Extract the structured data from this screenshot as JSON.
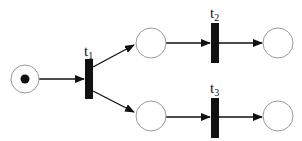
{
  "diagram": {
    "type": "petri-net",
    "colors": {
      "stroke": "#9a9a9a",
      "arc": "#111111",
      "transition": "#111111",
      "token": "#111111"
    },
    "places": [
      {
        "id": "p1",
        "tokens": 1
      },
      {
        "id": "p2",
        "tokens": 0
      },
      {
        "id": "p3",
        "tokens": 0
      },
      {
        "id": "p4",
        "tokens": 0
      },
      {
        "id": "p5",
        "tokens": 0
      }
    ],
    "transitions": [
      {
        "id": "t1",
        "label_base": "t",
        "label_sub": "1"
      },
      {
        "id": "t2",
        "label_base": "t",
        "label_sub": "2"
      },
      {
        "id": "t3",
        "label_base": "t",
        "label_sub": "3"
      }
    ],
    "arcs": [
      {
        "from": "p1",
        "to": "t1"
      },
      {
        "from": "t1",
        "to": "p2"
      },
      {
        "from": "t1",
        "to": "p3"
      },
      {
        "from": "p2",
        "to": "t2"
      },
      {
        "from": "p3",
        "to": "t3"
      },
      {
        "from": "t2",
        "to": "p4"
      },
      {
        "from": "t3",
        "to": "p5"
      }
    ]
  }
}
